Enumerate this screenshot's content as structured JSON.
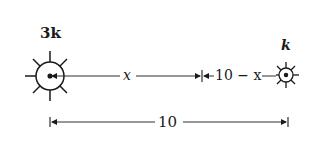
{
  "diagram": {
    "left_source": {
      "label": "3k",
      "shape": "sun-icon-large"
    },
    "right_source": {
      "label": "k",
      "shape": "sun-icon-small"
    },
    "segment_left": {
      "label": "x"
    },
    "segment_right": {
      "label": "10 − x"
    },
    "total_distance": {
      "label": "10"
    },
    "colors": {
      "ink": "#1a1a1a",
      "background": "#ffffff"
    }
  }
}
